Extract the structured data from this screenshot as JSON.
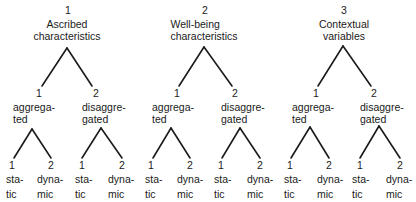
{
  "diagram": {
    "roots": [
      {
        "number": "1",
        "title_line1": "Ascribed",
        "title_line2": "characteristics",
        "children": [
          {
            "number": "1",
            "label_line1": "aggrega-",
            "label_line2": "ted",
            "leaves": [
              {
                "number": "1",
                "line1": "sta-",
                "line2": "tic"
              },
              {
                "number": "2",
                "line1": "dyna-",
                "line2": "mic"
              }
            ]
          },
          {
            "number": "2",
            "label_line1": "disaggre-",
            "label_line2": "gated",
            "leaves": [
              {
                "number": "1",
                "line1": "sta-",
                "line2": "tic"
              },
              {
                "number": "2",
                "line1": "dyna-",
                "line2": "mic"
              }
            ]
          }
        ]
      },
      {
        "number": "2",
        "title_line1": "Well-being",
        "title_line2": "characteristics",
        "children": [
          {
            "number": "1",
            "label_line1": "aggrega-",
            "label_line2": "ted",
            "leaves": [
              {
                "number": "1",
                "line1": "sta-",
                "line2": "tic"
              },
              {
                "number": "2",
                "line1": "dyna-",
                "line2": "mic"
              }
            ]
          },
          {
            "number": "2",
            "label_line1": "disaggre-",
            "label_line2": "gated",
            "leaves": [
              {
                "number": "1",
                "line1": "sta-",
                "line2": "tic"
              },
              {
                "number": "2",
                "line1": "dyna-",
                "line2": "mic"
              }
            ]
          }
        ]
      },
      {
        "number": "3",
        "title_line1": "Contextual",
        "title_line2": "variables",
        "children": [
          {
            "number": "1",
            "label_line1": "aggrega-",
            "label_line2": "ted",
            "leaves": [
              {
                "number": "1",
                "line1": "sta-",
                "line2": "tic"
              },
              {
                "number": "2",
                "line1": "dyna-",
                "line2": "mic"
              }
            ]
          },
          {
            "number": "2",
            "label_line1": "disaggre-",
            "label_line2": "gated",
            "leaves": [
              {
                "number": "1",
                "line1": "sta-",
                "line2": "tic"
              },
              {
                "number": "2",
                "line1": "dyna-",
                "line2": "mic"
              }
            ]
          }
        ]
      }
    ],
    "line_color": "#1a1a1a",
    "background": "#ffffff"
  }
}
